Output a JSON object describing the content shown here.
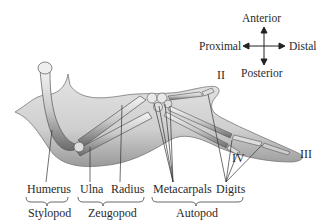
{
  "orientation": {
    "anterior": "Anterior",
    "posterior": "Posterior",
    "proximal": "Proximal",
    "distal": "Distal"
  },
  "digits": {
    "ii": "II",
    "iii": "III",
    "iv": "IV"
  },
  "bones": {
    "humerus": "Humerus",
    "ulna": "Ulna",
    "radius": "Radius",
    "metacarpals": "Metacarpals",
    "digits": "Digits"
  },
  "regions": {
    "stylopod": "Stylopod",
    "zeugopod": "Zeugopod",
    "autopod": "Autopod"
  }
}
